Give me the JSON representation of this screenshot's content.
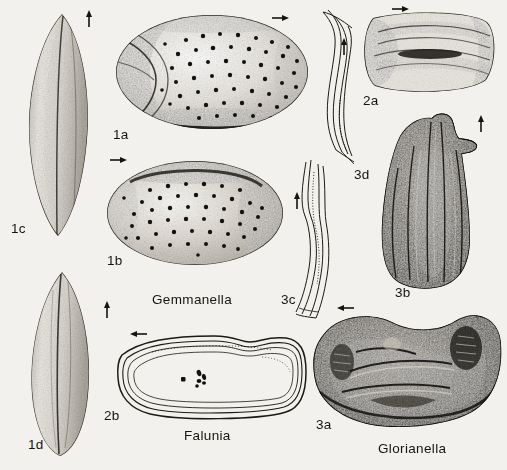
{
  "plate": {
    "background_color": "#f3f1ed",
    "ink_color": "#16140f",
    "genus_labels": [
      {
        "name": "Gemmanella",
        "x": 152,
        "y": 293
      },
      {
        "name": "Falunia",
        "x": 184,
        "y": 429
      },
      {
        "name": "Glorianella",
        "x": 378,
        "y": 442
      }
    ],
    "figure_labels": [
      {
        "id": "1a",
        "x": 113,
        "y": 128
      },
      {
        "id": "1b",
        "x": 107,
        "y": 254
      },
      {
        "id": "1c",
        "x": 11,
        "y": 222
      },
      {
        "id": "1d",
        "x": 28,
        "y": 438
      },
      {
        "id": "2a",
        "x": 363,
        "y": 94
      },
      {
        "id": "2b",
        "x": 104,
        "y": 409
      },
      {
        "id": "3a",
        "x": 316,
        "y": 418
      },
      {
        "id": "3b",
        "x": 395,
        "y": 286
      },
      {
        "id": "3c",
        "x": 281,
        "y": 293
      },
      {
        "id": "3d",
        "x": 354,
        "y": 168
      }
    ],
    "arrows": [
      {
        "for": "1c",
        "direction": "up",
        "x": 89,
        "y": 12
      },
      {
        "for": "1a",
        "direction": "right",
        "x": 272,
        "y": 18
      },
      {
        "for": "2a",
        "direction": "right",
        "x": 392,
        "y": 9
      },
      {
        "for": "1b",
        "direction": "right",
        "x": 110,
        "y": 160
      },
      {
        "for": "3d",
        "direction": "up",
        "x": 344,
        "y": 40
      },
      {
        "for": "3b",
        "direction": "up",
        "x": 481,
        "y": 117
      },
      {
        "for": "3c",
        "direction": "up",
        "x": 297,
        "y": 194
      },
      {
        "for": "1d",
        "direction": "up",
        "x": 107,
        "y": 303
      },
      {
        "for": "2b",
        "direction": "left",
        "x": 133,
        "y": 334
      },
      {
        "for": "3a",
        "direction": "left",
        "x": 340,
        "y": 308
      }
    ],
    "specimens": [
      {
        "id": "1c",
        "genus": "Gemmanella",
        "view": "dorsal-elongate-valve",
        "style": "stipple-shaded"
      },
      {
        "id": "1d",
        "genus": "Gemmanella",
        "view": "ventral-elongate-valve",
        "style": "stipple-shaded"
      },
      {
        "id": "1a",
        "genus": "Gemmanella",
        "view": "lateral-carapace",
        "style": "punctate-stippled"
      },
      {
        "id": "1b",
        "genus": "Gemmanella",
        "view": "lateral-valve",
        "style": "punctate-stippled"
      },
      {
        "id": "2a",
        "genus": "Falunia",
        "view": "lateral-valve",
        "style": "stipple-shaded"
      },
      {
        "id": "2b",
        "genus": "Falunia",
        "view": "outline-internal",
        "style": "line-outline"
      },
      {
        "id": "3a",
        "genus": "Glorianella",
        "view": "internal-mould",
        "style": "dark-stipple"
      },
      {
        "id": "3b",
        "genus": "Glorianella",
        "view": "dorsal-carapace",
        "style": "dark-stipple"
      },
      {
        "id": "3c",
        "genus": "Glorianella",
        "view": "hinge-outline",
        "style": "line-outline"
      },
      {
        "id": "3d",
        "genus": "Glorianella",
        "view": "hinge-outline",
        "style": "line-outline"
      }
    ]
  }
}
